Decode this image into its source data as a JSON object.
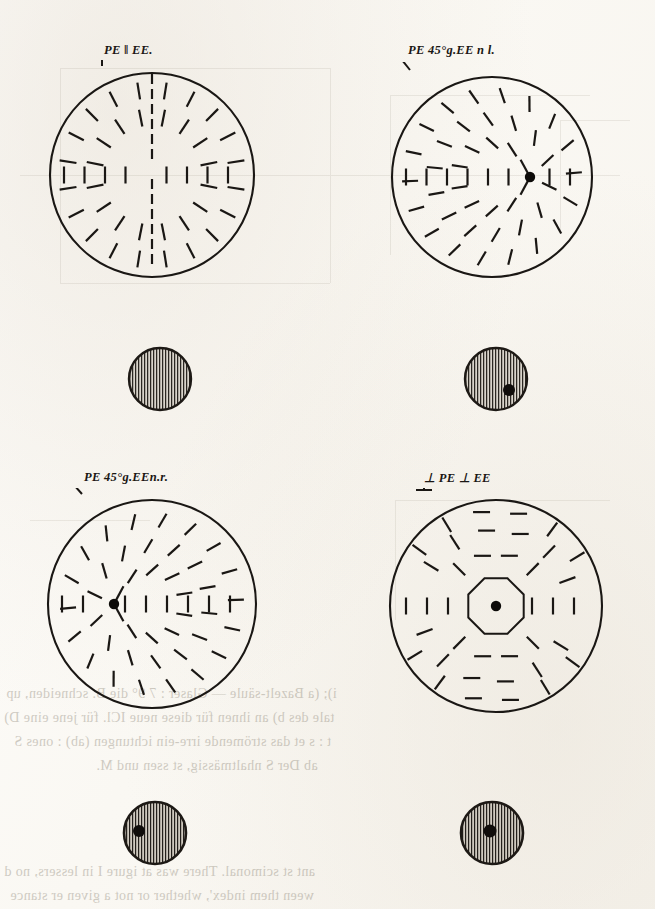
{
  "plate": {
    "title": "Polarization interference figures",
    "description": "Four conoscopic polarization figures with corresponding hatched section discs",
    "ink_color": "#1a1714",
    "paper_color": "#fdfcfa",
    "hatch_color": "#2a2621"
  },
  "figures": [
    {
      "id": "fig-1",
      "label": "PE ‖ EE.",
      "tick_glyph": "|",
      "tick_type": "vertical",
      "center_dot": false,
      "center_polygon": false,
      "dot_offset_x": 0,
      "pattern": "radial-cross",
      "cx": 152,
      "cy": 175,
      "r": 102
    },
    {
      "id": "fig-2",
      "label": "PE 45°g.EE n l.",
      "tick_glyph": "\\",
      "tick_type": "diagonal-back",
      "center_dot": true,
      "center_polygon": false,
      "dot_offset_x": 38,
      "pattern": "radial-offset-right",
      "cx": 492,
      "cy": 177,
      "r": 100
    },
    {
      "id": "fig-3",
      "label": "PE 45°g.EEn.r.",
      "tick_glyph": "/",
      "tick_type": "diagonal-forward",
      "center_dot": true,
      "center_polygon": false,
      "dot_offset_x": -38,
      "pattern": "radial-offset-left",
      "cx": 152,
      "cy": 604,
      "r": 104
    },
    {
      "id": "fig-4",
      "label": "⊥ PE ⊥ EE",
      "tick_glyph": "⊥",
      "tick_type": "perpendicular",
      "center_dot": true,
      "center_polygon": true,
      "dot_offset_x": 0,
      "pattern": "concentric-tangential",
      "cx": 496,
      "cy": 606,
      "r": 106
    }
  ],
  "discs": [
    {
      "id": "disc-1",
      "cx": 160,
      "cy": 379,
      "r": 31,
      "spot": false,
      "spot_dx": 0,
      "spot_dy": 0
    },
    {
      "id": "disc-2",
      "cx": 496,
      "cy": 379,
      "r": 31,
      "spot": true,
      "spot_dx": 13,
      "spot_dy": 11
    },
    {
      "id": "disc-3",
      "cx": 155,
      "cy": 833,
      "r": 31,
      "spot": true,
      "spot_dx": -16,
      "spot_dy": -2
    },
    {
      "id": "disc-4",
      "cx": 492,
      "cy": 833,
      "r": 31,
      "spot": true,
      "spot_dx": -2,
      "spot_dy": -2
    }
  ],
  "bleed_text": [
    {
      "id": "bt-1",
      "text": "i); (a Bazelt-säule — Glaser : 7 9° die B. schneiden, up",
      "x": 6,
      "y": 688,
      "size": 14
    },
    {
      "id": "bt-2",
      "text": "tale des b) an ihnen für diese neue ICl. für jene eine D)",
      "x": 4,
      "y": 712,
      "size": 14
    },
    {
      "id": "bt-3",
      "text": "t   : s et das strömende irre-ein ichtungen (ab)   : ones S",
      "x": 14,
      "y": 736,
      "size": 14
    },
    {
      "id": "bt-4",
      "text": "ab   Der S nhaltmässig, st ssen und M.",
      "x": 96,
      "y": 760,
      "size": 14
    },
    {
      "id": "bt-5",
      "text": "ant st scimonal.  There was at   igure I   in lessers, no d",
      "x": 4,
      "y": 866,
      "size": 14
    },
    {
      "id": "bt-6",
      "text": "ween them index', whether or not a given  er stance",
      "x": 10,
      "y": 890,
      "size": 14
    }
  ]
}
